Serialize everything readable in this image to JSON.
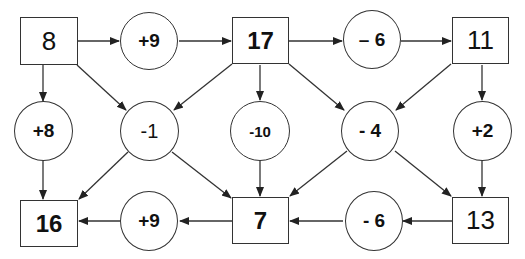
{
  "diagram": {
    "boxes": [
      {
        "id": "b8",
        "label": "8"
      },
      {
        "id": "b17",
        "label": "17"
      },
      {
        "id": "b11",
        "label": "11"
      },
      {
        "id": "b16",
        "label": "16"
      },
      {
        "id": "b7",
        "label": "7"
      },
      {
        "id": "b13",
        "label": "13"
      }
    ],
    "circles": [
      {
        "id": "c_top1",
        "label": "+9"
      },
      {
        "id": "c_top2",
        "label": "– 6"
      },
      {
        "id": "c_mid1",
        "label": "+8"
      },
      {
        "id": "c_mid2",
        "label": "-1"
      },
      {
        "id": "c_mid3",
        "label": "-10"
      },
      {
        "id": "c_mid4",
        "label": "- 4"
      },
      {
        "id": "c_mid5",
        "label": "+2"
      },
      {
        "id": "c_bot1",
        "label": "+9"
      },
      {
        "id": "c_bot2",
        "label": "- 6"
      }
    ],
    "edges": [
      [
        "8",
        "+9"
      ],
      [
        "+9",
        "17"
      ],
      [
        "17",
        "-6"
      ],
      [
        "-6",
        "11"
      ],
      [
        "8",
        "+8"
      ],
      [
        "8",
        "-1"
      ],
      [
        "17",
        "-1"
      ],
      [
        "17",
        "-10"
      ],
      [
        "17",
        "-4"
      ],
      [
        "11",
        "-4"
      ],
      [
        "11",
        "+2"
      ],
      [
        "+8",
        "16"
      ],
      [
        "-1",
        "16"
      ],
      [
        "-1",
        "7"
      ],
      [
        "-10",
        "7"
      ],
      [
        "-4",
        "7"
      ],
      [
        "-4",
        "13"
      ],
      [
        "+2",
        "13"
      ],
      [
        "7",
        "+9 (bottom)"
      ],
      [
        "+9 (bottom)",
        "16"
      ],
      [
        "13",
        "-6 (bottom)"
      ],
      [
        "-6 (bottom)",
        "7"
      ]
    ],
    "colors": {
      "stroke": "#333333",
      "text": "#111111",
      "background": "#ffffff"
    }
  }
}
